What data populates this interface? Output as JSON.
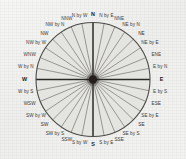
{
  "figure": {
    "kind": "compass-rose",
    "center_x": 93,
    "center_y": 79.5,
    "radius": 57,
    "hub_radius": 4.2,
    "label_radius": 65,
    "spoke_count": 32,
    "degrees_per_point": 11.25,
    "colors": {
      "page": "#f2f2f0",
      "disc_fill": "#e4e4e1",
      "rim": "#4a4a47",
      "spoke": "#55534f",
      "axis": "#2a2a28",
      "hub": "#241f1c",
      "label": "#3a3a38"
    }
  },
  "points": [
    {
      "label": "N",
      "rank": "cardinal"
    },
    {
      "label": "N by E",
      "rank": "by"
    },
    {
      "label": "NNE",
      "rank": "half"
    },
    {
      "label": "NE by N",
      "rank": "by"
    },
    {
      "label": "NE",
      "rank": "ordinal"
    },
    {
      "label": "NE by E",
      "rank": "by"
    },
    {
      "label": "ENE",
      "rank": "half"
    },
    {
      "label": "E by N",
      "rank": "by"
    },
    {
      "label": "E",
      "rank": "cardinal"
    },
    {
      "label": "E by S",
      "rank": "by"
    },
    {
      "label": "ESE",
      "rank": "half"
    },
    {
      "label": "SE by E",
      "rank": "by"
    },
    {
      "label": "SE",
      "rank": "ordinal"
    },
    {
      "label": "SE by S",
      "rank": "by"
    },
    {
      "label": "SSE",
      "rank": "half"
    },
    {
      "label": "S by E",
      "rank": "by"
    },
    {
      "label": "S",
      "rank": "cardinal"
    },
    {
      "label": "S by W",
      "rank": "by"
    },
    {
      "label": "SSW",
      "rank": "half"
    },
    {
      "label": "SW by S",
      "rank": "by"
    },
    {
      "label": "SW",
      "rank": "ordinal"
    },
    {
      "label": "SW by W",
      "rank": "by"
    },
    {
      "label": "WSW",
      "rank": "half"
    },
    {
      "label": "W by S",
      "rank": "by"
    },
    {
      "label": "W",
      "rank": "cardinal"
    },
    {
      "label": "W by N",
      "rank": "by"
    },
    {
      "label": "WNW",
      "rank": "half"
    },
    {
      "label": "NW by W",
      "rank": "by"
    },
    {
      "label": "NW",
      "rank": "ordinal"
    },
    {
      "label": "NW by N",
      "rank": "by"
    },
    {
      "label": "NNW",
      "rank": "half"
    },
    {
      "label": "N by W",
      "rank": "by"
    }
  ]
}
